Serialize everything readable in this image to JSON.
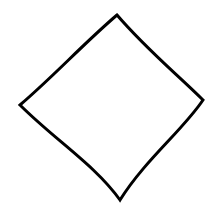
{
  "canvas": {
    "width": 222,
    "height": 215,
    "background": "#ffffff"
  },
  "shape": {
    "type": "diamond",
    "label": "",
    "stroke_color": "#000000",
    "stroke_width": 3,
    "fill": "none",
    "style": "hand-drawn sketch",
    "vertices": {
      "top": [
        117,
        15
      ],
      "right": [
        203,
        100
      ],
      "bottom": [
        120,
        200
      ],
      "left": [
        20,
        105
      ]
    }
  }
}
